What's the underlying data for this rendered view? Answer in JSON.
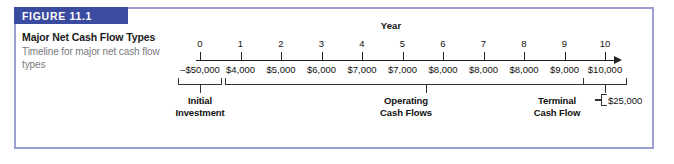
{
  "figure": {
    "banner_label": "FIGURE 11.1",
    "title": "Major Net Cash Flow Types",
    "subtitle": "Timeline for major net cash flow types",
    "accent_color": "#3b4ba0",
    "frame_border_color": "#9aa0d4"
  },
  "chart_data": {
    "type": "timeline",
    "title": "Major Net Cash Flow Types",
    "axis_heading": "Year",
    "xlabel": "Year",
    "ylabel": "",
    "categories": [
      "0",
      "1",
      "2",
      "3",
      "4",
      "5",
      "6",
      "7",
      "8",
      "9",
      "10"
    ],
    "values": [
      "–$50,000",
      "$4,000",
      "$5,000",
      "$6,000",
      "$7,000",
      "$7,000",
      "$8,000",
      "$8,000",
      "$8,000",
      "$9,000",
      "$10,000"
    ],
    "numeric_values": [
      -50000,
      4000,
      5000,
      6000,
      7000,
      7000,
      8000,
      8000,
      8000,
      9000,
      10000
    ],
    "groups": [
      {
        "label_line1": "Initial",
        "label_line2": "Investment",
        "from_year": 0,
        "to_year": 0
      },
      {
        "label_line1": "Operating",
        "label_line2": "Cash Flows",
        "from_year": 1,
        "to_year": 10
      },
      {
        "label_line1": "Terminal",
        "label_line2": "Cash Flow",
        "from_year": 10,
        "to_year": 10
      }
    ],
    "terminal_value": "$25,000",
    "grid": false,
    "legend": "none"
  }
}
